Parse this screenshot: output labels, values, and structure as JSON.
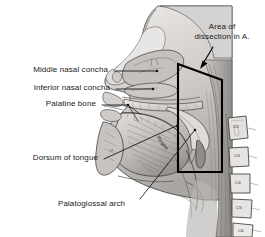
{
  "figure": {
    "background_color": "#ffffff",
    "width": 265,
    "height": 237
  },
  "callout": {
    "line1": "Area of",
    "line2": "dissection in A.",
    "arrow_icon": "curved-arrow-icon",
    "box_color": "#000000"
  },
  "labels": [
    {
      "id": "middle-nasal-concha",
      "text": "Middle nasal concha"
    },
    {
      "id": "inferior-nasal-concha",
      "text": "Inferior nasal concha"
    },
    {
      "id": "palatine-bone",
      "text": "Palatine bone"
    },
    {
      "id": "dorsum-of-tongue",
      "text": "Dorsum of tongue"
    },
    {
      "id": "palatoglossal-arch",
      "text": "Palatoglossal arch"
    }
  ],
  "in_figure_labels": [
    {
      "id": "tongue",
      "text": "Tongue"
    }
  ],
  "vertebrae": [
    {
      "id": "c2",
      "text": "C2"
    },
    {
      "id": "c3",
      "text": "C3"
    },
    {
      "id": "c4",
      "text": "C4"
    },
    {
      "id": "c5",
      "text": "C5"
    },
    {
      "id": "c6",
      "text": "C6"
    }
  ],
  "colors": {
    "ink": "#1a1a1a",
    "leader": "#111111",
    "tissue_light": "#d8d6d4",
    "tissue_mid": "#b4b1ae",
    "tissue_dark": "#8d8a87",
    "outline": "#3a3a3a"
  }
}
